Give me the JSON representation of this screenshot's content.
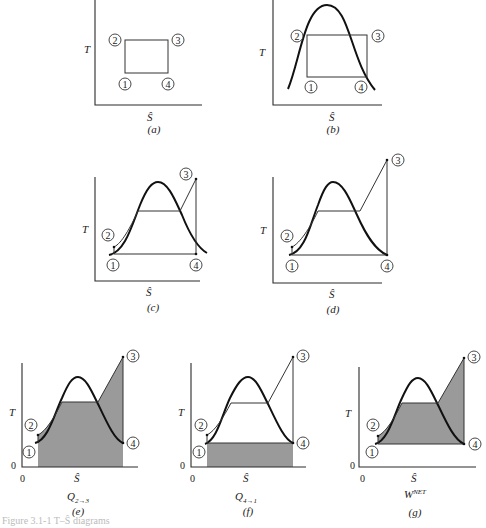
{
  "figure": {
    "axes": {
      "y_label": "T",
      "x_label": "Ŝ",
      "origin_zero": "0"
    },
    "nodes": [
      "1",
      "2",
      "3",
      "4"
    ],
    "panels": [
      {
        "id": "a",
        "label": "(a)",
        "description": "Carnot cycle rectangle on T-Ŝ axes"
      },
      {
        "id": "b",
        "label": "(b)",
        "description": "Carnot rectangle inside vapor dome"
      },
      {
        "id": "c",
        "label": "(c)",
        "description": "Rankine cycle with superheat, expansion into two-phase region"
      },
      {
        "id": "d",
        "label": "(d)",
        "description": "Rankine cycle with superheat, expansion to saturated vapor"
      },
      {
        "id": "e",
        "label": "(e)",
        "sublabel": "Q2→3",
        "sub_main": "Q",
        "sub_script": "2→3",
        "description": "Shaded area: heat added 2→3"
      },
      {
        "id": "f",
        "label": "(f)",
        "sublabel": "Q4→1",
        "sub_main": "Q",
        "sub_script": "4→1",
        "description": "Shaded area: heat rejected 4→1"
      },
      {
        "id": "g",
        "label": "(g)",
        "sublabel": "WNET",
        "sub_main": "W",
        "sub_script": "NET",
        "description": "Shaded area: net work"
      }
    ]
  },
  "caption": {
    "text": "Figure 3.1-1  T–Ŝ diagrams"
  },
  "colors": {
    "shade": "#9a9a9a",
    "line": "#111111",
    "background": "#ffffff"
  }
}
